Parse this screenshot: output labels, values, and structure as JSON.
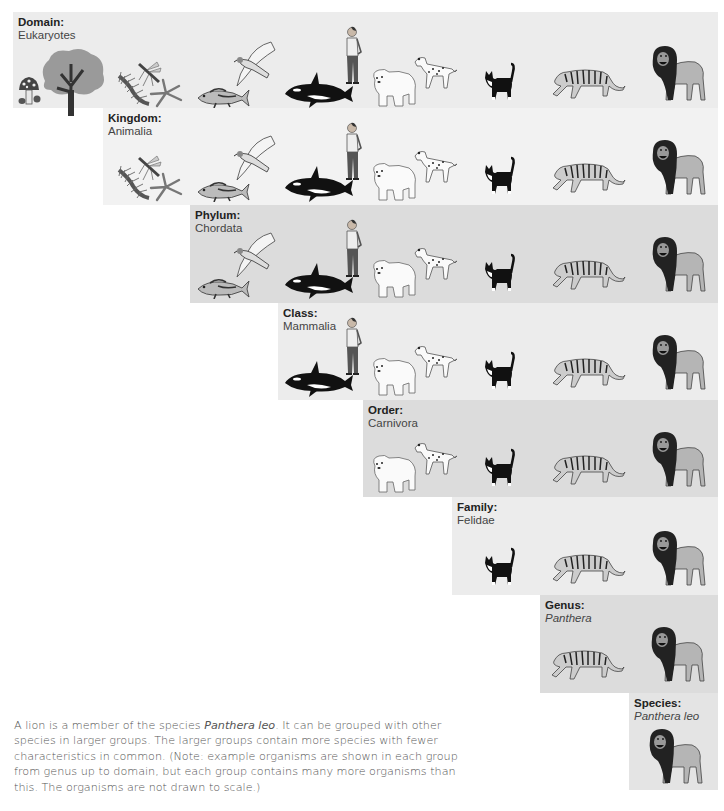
{
  "levels": [
    {
      "rank": "Domain:",
      "taxon": "Eukaryotes",
      "italic": false,
      "organisms": [
        "mushroom",
        "tree",
        "centipede",
        "mosquito",
        "starfish",
        "fish",
        "hawk",
        "orca",
        "human",
        "polar-bear",
        "dalmatian",
        "cat",
        "tiger",
        "lion"
      ]
    },
    {
      "rank": "Kingdom:",
      "taxon": "Animalia",
      "italic": false,
      "organisms": [
        "centipede",
        "mosquito",
        "starfish",
        "fish",
        "hawk",
        "orca",
        "human",
        "polar-bear",
        "dalmatian",
        "cat",
        "tiger",
        "lion"
      ]
    },
    {
      "rank": "Phylum:",
      "taxon": "Chordata",
      "italic": false,
      "organisms": [
        "fish",
        "hawk",
        "orca",
        "human",
        "polar-bear",
        "dalmatian",
        "cat",
        "tiger",
        "lion"
      ]
    },
    {
      "rank": "Class:",
      "taxon": "Mammalia",
      "italic": false,
      "organisms": [
        "orca",
        "human",
        "polar-bear",
        "dalmatian",
        "cat",
        "tiger",
        "lion"
      ]
    },
    {
      "rank": "Order:",
      "taxon": "Carnivora",
      "italic": false,
      "organisms": [
        "polar-bear",
        "dalmatian",
        "cat",
        "tiger",
        "lion"
      ]
    },
    {
      "rank": "Family:",
      "taxon": "Felidae",
      "italic": false,
      "organisms": [
        "cat",
        "tiger",
        "lion"
      ]
    },
    {
      "rank": "Genus:",
      "taxon": "Panthera",
      "italic": true,
      "organisms": [
        "tiger",
        "lion"
      ]
    },
    {
      "rank": "Species:",
      "taxon": "Panthera leo",
      "italic": true,
      "organisms": [
        "lion"
      ]
    }
  ],
  "caption": {
    "part1": "A lion is a member of the species ",
    "italic": "Panthera leo",
    "part2": ". It can be grouped with other species in larger groups. The larger groups contain more species with fewer characteristics in common. (Note: example organisms are shown in each group from genus up to domain, but each group contains many more organisms than this. The organisms are not drawn to scale.)"
  },
  "colors": {
    "panel_light": "#ececec",
    "panel_dark": "#dcdcdc",
    "label": "#222222",
    "caption": "#555555"
  }
}
